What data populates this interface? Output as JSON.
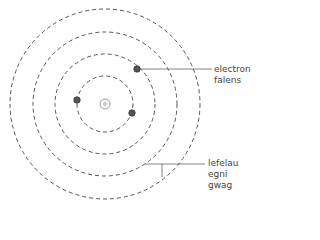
{
  "diagram": {
    "type": "atom-shell-model",
    "nucleus": {
      "symbol": "+"
    },
    "shells": 4,
    "electrons": 3,
    "labels": {
      "valence_line1": "electron",
      "valence_line2": "falens",
      "shells_line1": "lefelau",
      "shells_line2": "egni gwag"
    },
    "colors": {
      "line": "#555555",
      "electron": "#444444",
      "nucleus": "#888888"
    }
  }
}
